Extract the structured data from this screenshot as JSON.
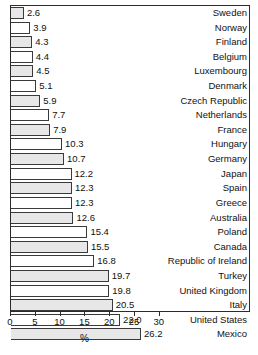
{
  "chart_data": {
    "type": "bar",
    "orientation": "horizontal",
    "title": "",
    "xlabel": "%",
    "ylabel": "",
    "xlim": [
      0,
      30
    ],
    "xticks": [
      0,
      5,
      10,
      15,
      20,
      25,
      30
    ],
    "grid": false,
    "legend": null,
    "bar_colors": [
      "#e7e7e7",
      "#ffffff"
    ],
    "bar_edge_color": "#3a3a3a",
    "frame_color": "#2b2b2b",
    "categories": [
      "Sweden",
      "Norway",
      "Finland",
      "Belgium",
      "Luxembourg",
      "Denmark",
      "Czech Republic",
      "Netherlands",
      "France",
      "Hungary",
      "Germany",
      "Japan",
      "Spain",
      "Greece",
      "Australia",
      "Poland",
      "Canada",
      "Republic of Ireland",
      "Turkey",
      "United Kingdom",
      "Italy",
      "United States",
      "Mexico"
    ],
    "values": [
      2.6,
      3.9,
      4.3,
      4.4,
      4.5,
      5.1,
      5.9,
      7.7,
      7.9,
      10.3,
      10.7,
      12.2,
      12.3,
      12.3,
      12.6,
      15.4,
      15.5,
      16.8,
      19.7,
      19.8,
      20.5,
      22.0,
      26.2
    ],
    "value_labels": [
      "2.6",
      "3.9",
      "4.3",
      "4.4",
      "4.5",
      "5.1",
      "5.9",
      "7.7",
      "7.9",
      "10.3",
      "10.7",
      "12.2",
      "12.3",
      "12.3",
      "12.6",
      "15.4",
      "15.5",
      "16.8",
      "19.7",
      "19.8",
      "20.5",
      "22.0",
      "26.2"
    ]
  },
  "axis": {
    "tick_labels": [
      "0",
      "5",
      "10",
      "15",
      "20",
      "25",
      "30"
    ],
    "title": "%"
  }
}
